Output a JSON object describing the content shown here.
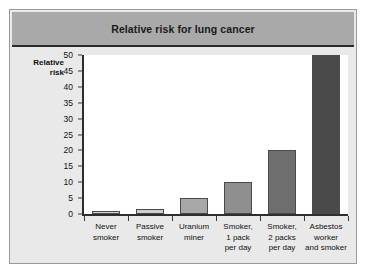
{
  "figure": {
    "title": "Relative risk for lung cancer",
    "y_axis_title_line1": "Relative",
    "y_axis_title_line2": "risk"
  },
  "chart_data": {
    "type": "bar",
    "title": "Relative risk for lung cancer",
    "xlabel": "",
    "ylabel": "Relative risk",
    "ylim": [
      0,
      50
    ],
    "yticks": [
      0,
      5,
      10,
      15,
      20,
      25,
      30,
      35,
      40,
      45,
      50
    ],
    "grid": false,
    "legend": "none",
    "categories": [
      "Never smoker",
      "Passive smoker",
      "Uranium miner",
      "Smoker, 1 pack per day",
      "Smoker, 2 packs per day",
      "Asbestos worker and smoker"
    ],
    "category_label_lines": [
      [
        "Never",
        "smoker"
      ],
      [
        "Passive",
        "smoker"
      ],
      [
        "Uranium",
        "miner"
      ],
      [
        "Smoker,",
        "1 pack",
        "per day"
      ],
      [
        "Smoker,",
        "2 packs",
        "per day"
      ],
      [
        "Asbestos",
        "worker",
        "and smoker"
      ]
    ],
    "values": [
      1,
      1.5,
      5,
      10,
      20,
      50
    ],
    "bar_colors": [
      "#d6d6d6",
      "#cfcfcf",
      "#a8a8a8",
      "#8f8f8f",
      "#6e6e6e",
      "#4a4a4a"
    ]
  },
  "colors": {
    "title_band": "#a9a9a9",
    "figure_background": "#e9e9e9",
    "plot_background": "#ffffff",
    "axis": "#2e2e2e",
    "frame_border": "#9a9a9a"
  }
}
